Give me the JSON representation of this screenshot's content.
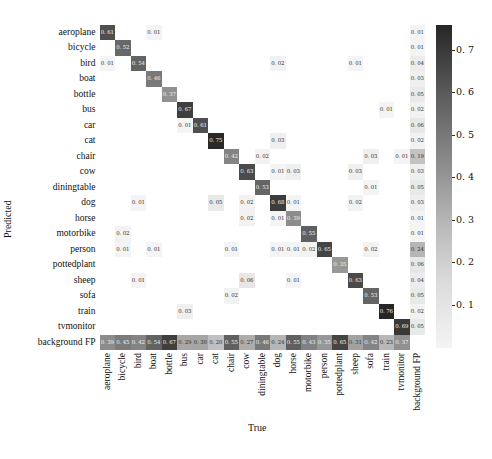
{
  "chart_data": {
    "type": "heatmap",
    "title": "",
    "xlabel": "True",
    "ylabel": "Predicted",
    "x_categories": [
      "aeroplane",
      "bicycle",
      "bird",
      "boat",
      "bottle",
      "bus",
      "car",
      "cat",
      "chair",
      "cow",
      "diningtable",
      "dog",
      "horse",
      "motorbike",
      "person",
      "pottedplant",
      "sheep",
      "sofa",
      "train",
      "tvmonitor",
      "background FP"
    ],
    "y_categories": [
      "aeroplane",
      "bicycle",
      "bird",
      "boat",
      "bottle",
      "bus",
      "car",
      "cat",
      "chair",
      "cow",
      "diningtable",
      "dog",
      "horse",
      "motorbike",
      "person",
      "pottedplant",
      "sheep",
      "sofa",
      "train",
      "tvmonitor",
      "background FP"
    ],
    "cells": [
      {
        "row": "aeroplane",
        "col": "aeroplane",
        "value": 0.61
      },
      {
        "row": "aeroplane",
        "col": "boat",
        "value": 0.01
      },
      {
        "row": "aeroplane",
        "col": "background FP",
        "value": 0.01
      },
      {
        "row": "bicycle",
        "col": "bicycle",
        "value": 0.52
      },
      {
        "row": "bicycle",
        "col": "background FP",
        "value": 0.01
      },
      {
        "row": "bird",
        "col": "aeroplane",
        "value": 0.01
      },
      {
        "row": "bird",
        "col": "bird",
        "value": 0.54
      },
      {
        "row": "bird",
        "col": "dog",
        "value": 0.02
      },
      {
        "row": "bird",
        "col": "sheep",
        "value": 0.01
      },
      {
        "row": "bird",
        "col": "background FP",
        "value": 0.04
      },
      {
        "row": "boat",
        "col": "boat",
        "value": 0.46
      },
      {
        "row": "boat",
        "col": "background FP",
        "value": 0.03
      },
      {
        "row": "bottle",
        "col": "bottle",
        "value": 0.37
      },
      {
        "row": "bottle",
        "col": "background FP",
        "value": 0.05
      },
      {
        "row": "bus",
        "col": "bus",
        "value": 0.67
      },
      {
        "row": "bus",
        "col": "train",
        "value": 0.01
      },
      {
        "row": "bus",
        "col": "background FP",
        "value": 0.02
      },
      {
        "row": "car",
        "col": "bus",
        "value": 0.01
      },
      {
        "row": "car",
        "col": "car",
        "value": 0.61
      },
      {
        "row": "car",
        "col": "background FP",
        "value": 0.06
      },
      {
        "row": "cat",
        "col": "cat",
        "value": 0.75
      },
      {
        "row": "cat",
        "col": "dog",
        "value": 0.03
      },
      {
        "row": "cat",
        "col": "background FP",
        "value": 0.02
      },
      {
        "row": "chair",
        "col": "chair",
        "value": 0.42
      },
      {
        "row": "chair",
        "col": "diningtable",
        "value": 0.02
      },
      {
        "row": "chair",
        "col": "sofa",
        "value": 0.03
      },
      {
        "row": "chair",
        "col": "tvmonitor",
        "value": 0.01
      },
      {
        "row": "chair",
        "col": "background FP",
        "value": 0.19
      },
      {
        "row": "cow",
        "col": "cow",
        "value": 0.63
      },
      {
        "row": "cow",
        "col": "dog",
        "value": 0.01
      },
      {
        "row": "cow",
        "col": "horse",
        "value": 0.03
      },
      {
        "row": "cow",
        "col": "sheep",
        "value": 0.03
      },
      {
        "row": "cow",
        "col": "background FP",
        "value": 0.03
      },
      {
        "row": "diningtable",
        "col": "diningtable",
        "value": 0.53
      },
      {
        "row": "diningtable",
        "col": "sofa",
        "value": 0.01
      },
      {
        "row": "diningtable",
        "col": "background FP",
        "value": 0.05
      },
      {
        "row": "dog",
        "col": "bird",
        "value": 0.01
      },
      {
        "row": "dog",
        "col": "cat",
        "value": 0.05
      },
      {
        "row": "dog",
        "col": "cow",
        "value": 0.02
      },
      {
        "row": "dog",
        "col": "dog",
        "value": 0.68
      },
      {
        "row": "dog",
        "col": "horse",
        "value": 0.01
      },
      {
        "row": "dog",
        "col": "sheep",
        "value": 0.02
      },
      {
        "row": "dog",
        "col": "background FP",
        "value": 0.03
      },
      {
        "row": "horse",
        "col": "cow",
        "value": 0.02
      },
      {
        "row": "horse",
        "col": "dog",
        "value": 0.01
      },
      {
        "row": "horse",
        "col": "horse",
        "value": 0.39
      },
      {
        "row": "horse",
        "col": "background FP",
        "value": 0.01
      },
      {
        "row": "motorbike",
        "col": "bicycle",
        "value": 0.02
      },
      {
        "row": "motorbike",
        "col": "motorbike",
        "value": 0.55
      },
      {
        "row": "motorbike",
        "col": "background FP",
        "value": 0.01
      },
      {
        "row": "person",
        "col": "bicycle",
        "value": 0.01
      },
      {
        "row": "person",
        "col": "boat",
        "value": 0.01
      },
      {
        "row": "person",
        "col": "chair",
        "value": 0.01
      },
      {
        "row": "person",
        "col": "dog",
        "value": 0.01
      },
      {
        "row": "person",
        "col": "horse",
        "value": 0.01
      },
      {
        "row": "person",
        "col": "motorbike",
        "value": 0.02
      },
      {
        "row": "person",
        "col": "person",
        "value": 0.65
      },
      {
        "row": "person",
        "col": "sofa",
        "value": 0.02
      },
      {
        "row": "person",
        "col": "background FP",
        "value": 0.24
      },
      {
        "row": "pottedplant",
        "col": "pottedplant",
        "value": 0.35
      },
      {
        "row": "pottedplant",
        "col": "background FP",
        "value": 0.06
      },
      {
        "row": "sheep",
        "col": "bird",
        "value": 0.01
      },
      {
        "row": "sheep",
        "col": "cow",
        "value": 0.06
      },
      {
        "row": "sheep",
        "col": "horse",
        "value": 0.01
      },
      {
        "row": "sheep",
        "col": "sheep",
        "value": 0.63
      },
      {
        "row": "sheep",
        "col": "background FP",
        "value": 0.04
      },
      {
        "row": "sofa",
        "col": "chair",
        "value": 0.02
      },
      {
        "row": "sofa",
        "col": "sofa",
        "value": 0.53
      },
      {
        "row": "sofa",
        "col": "background FP",
        "value": 0.05
      },
      {
        "row": "train",
        "col": "bus",
        "value": 0.03
      },
      {
        "row": "train",
        "col": "train",
        "value": 0.76
      },
      {
        "row": "train",
        "col": "background FP",
        "value": 0.02
      },
      {
        "row": "tvmonitor",
        "col": "tvmonitor",
        "value": 0.69
      },
      {
        "row": "tvmonitor",
        "col": "background FP",
        "value": 0.05
      },
      {
        "row": "background FP",
        "col": "aeroplane",
        "value": 0.39
      },
      {
        "row": "background FP",
        "col": "bicycle",
        "value": 0.45
      },
      {
        "row": "background FP",
        "col": "bird",
        "value": 0.42
      },
      {
        "row": "background FP",
        "col": "boat",
        "value": 0.54
      },
      {
        "row": "background FP",
        "col": "bottle",
        "value": 0.67
      },
      {
        "row": "background FP",
        "col": "bus",
        "value": 0.29
      },
      {
        "row": "background FP",
        "col": "car",
        "value": 0.3
      },
      {
        "row": "background FP",
        "col": "cat",
        "value": 0.2
      },
      {
        "row": "background FP",
        "col": "chair",
        "value": 0.55
      },
      {
        "row": "background FP",
        "col": "cow",
        "value": 0.27
      },
      {
        "row": "background FP",
        "col": "diningtable",
        "value": 0.46
      },
      {
        "row": "background FP",
        "col": "dog",
        "value": 0.24
      },
      {
        "row": "background FP",
        "col": "horse",
        "value": 0.55
      },
      {
        "row": "background FP",
        "col": "motorbike",
        "value": 0.43
      },
      {
        "row": "background FP",
        "col": "person",
        "value": 0.35
      },
      {
        "row": "background FP",
        "col": "pottedplant",
        "value": 0.65
      },
      {
        "row": "background FP",
        "col": "sheep",
        "value": 0.31
      },
      {
        "row": "background FP",
        "col": "sofa",
        "value": 0.42
      },
      {
        "row": "background FP",
        "col": "train",
        "value": 0.23
      },
      {
        "row": "background FP",
        "col": "tvmonitor",
        "value": 0.37
      }
    ],
    "colorbar": {
      "ticks": [
        0.1,
        0.2,
        0.3,
        0.4,
        0.5,
        0.6,
        0.7
      ],
      "range": [
        0.0,
        0.76
      ],
      "colormap": "Greys"
    },
    "grid": false,
    "legend_position": "right (colorbar)"
  }
}
